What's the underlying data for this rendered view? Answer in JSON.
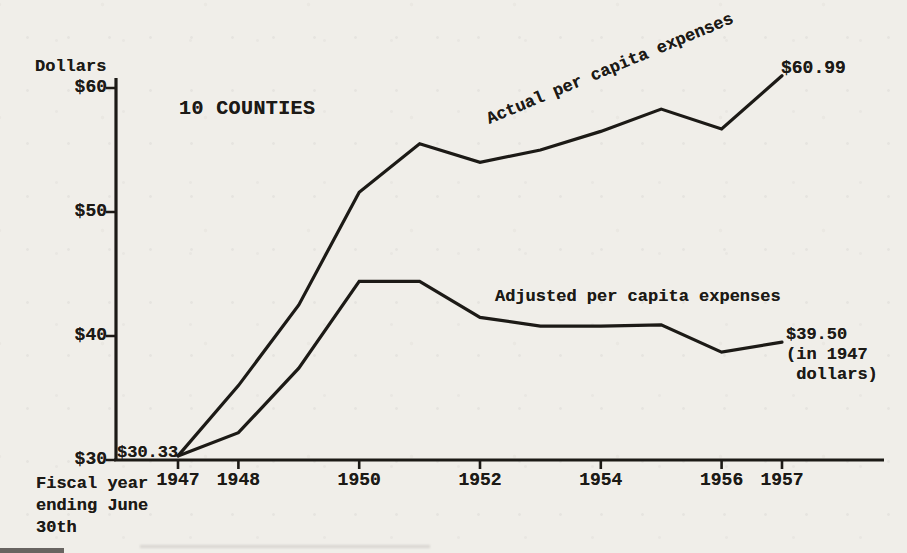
{
  "page": {
    "background_color": "#f0eee9",
    "ink_color": "#1c1a16"
  },
  "chart_data": {
    "type": "line",
    "title": "10 COUNTIES",
    "y_axis_label": "Dollars",
    "x_caption": "Fiscal year\nending June\n30th",
    "x": [
      1947,
      1948,
      1949,
      1950,
      1951,
      1952,
      1953,
      1954,
      1955,
      1956,
      1957
    ],
    "series": [
      {
        "name": "Actual per capita expenses",
        "values": [
          30.33,
          36.0,
          42.5,
          51.6,
          55.5,
          54.0,
          55.0,
          56.5,
          58.3,
          56.7,
          60.99
        ]
      },
      {
        "name": "Adjusted per capita expenses",
        "values": [
          30.33,
          32.2,
          37.4,
          44.4,
          44.4,
          41.5,
          40.8,
          40.8,
          40.9,
          38.7,
          39.5
        ]
      }
    ],
    "x_ticks": [
      {
        "label": "1947",
        "value": 1947
      },
      {
        "label": "1948",
        "value": 1948
      },
      {
        "label": "1950",
        "value": 1950
      },
      {
        "label": "1952",
        "value": 1952
      },
      {
        "label": "1954",
        "value": 1954
      },
      {
        "label": "1956",
        "value": 1956
      },
      {
        "label": "1957",
        "value": 1957
      }
    ],
    "y_ticks": [
      {
        "label": "$30",
        "value": 30
      },
      {
        "label": "$40",
        "value": 40
      },
      {
        "label": "$50",
        "value": 50
      },
      {
        "label": "$60",
        "value": 60
      }
    ],
    "ylim": [
      30,
      62
    ],
    "xlim": [
      1947,
      1957
    ],
    "grid": false,
    "legend_position": "inline-labels",
    "annotations": {
      "start_value": "$30.33",
      "actual_end": "$60.99",
      "adjusted_end": "$39.50\n(in 1947\n dollars)"
    }
  }
}
